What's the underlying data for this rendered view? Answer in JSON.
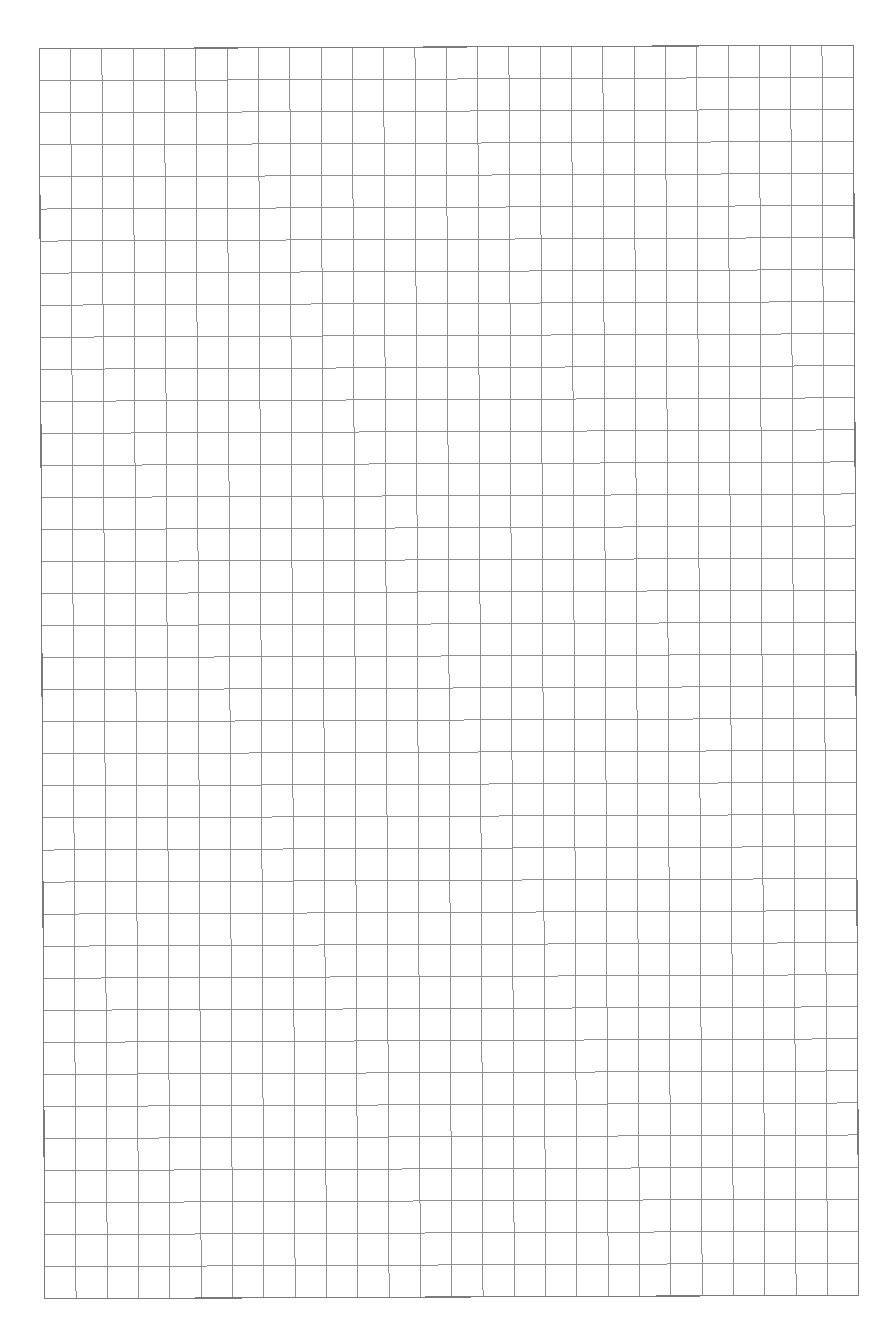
{
  "page": {
    "type": "graph-paper",
    "background_color": "#ffffff"
  },
  "grid": {
    "columns": 26,
    "rows": 39,
    "left": 42,
    "top": 47,
    "right": 856,
    "bottom": 1297,
    "line_color": "#8f8f8f",
    "border_color": "#7a7a7a",
    "line_width": 1,
    "border_width": 1.2,
    "rotation_deg": -0.25
  }
}
